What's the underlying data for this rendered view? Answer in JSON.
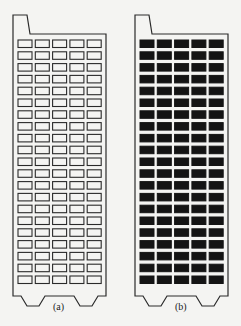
{
  "figure": {
    "panels": [
      {
        "id": "a",
        "caption": "(a)",
        "cell_style": "hollow",
        "rows": 21,
        "cols": 5
      },
      {
        "id": "b",
        "caption": "(b)",
        "cell_style": "filled",
        "rows": 21,
        "cols": 5
      }
    ],
    "colors": {
      "stroke": "#2a2a2a",
      "fill": "#141414",
      "background": "#f4f4f2"
    }
  }
}
